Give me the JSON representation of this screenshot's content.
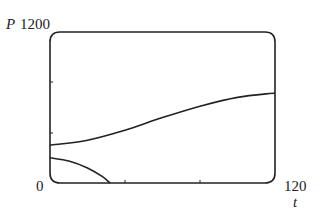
{
  "chart_data": {
    "type": "line",
    "title": "",
    "xlabel": "t",
    "ylabel": "P",
    "xlim": [
      0,
      120
    ],
    "ylim": [
      0,
      1200
    ],
    "x_tick_labels": [
      "0",
      "120"
    ],
    "y_tick_labels": [
      "0",
      "1200"
    ],
    "x_ticks_unlabeled": [
      40,
      80
    ],
    "y_ticks_unlabeled": [
      400,
      800
    ],
    "grid": false,
    "legend": null,
    "series": [
      {
        "name": "upper curve",
        "x": [
          0,
          20,
          40,
          60,
          80,
          100,
          120
        ],
        "values": [
          300,
          340,
          420,
          520,
          610,
          680,
          715
        ]
      },
      {
        "name": "lower curve",
        "x": [
          0,
          10,
          20,
          28,
          32
        ],
        "values": [
          200,
          175,
          120,
          50,
          0
        ]
      }
    ]
  },
  "labels": {
    "y_axis_var": "P",
    "y_max": "1200",
    "origin": "0",
    "x_max": "120",
    "x_axis_var": "t"
  }
}
